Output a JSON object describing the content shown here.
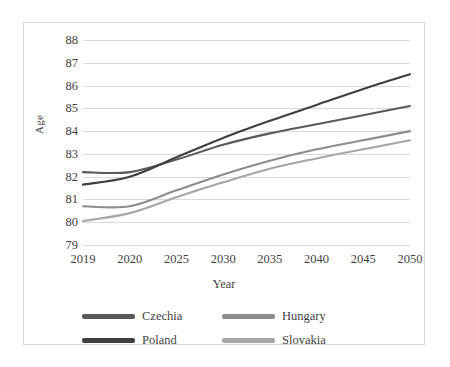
{
  "chart_data": {
    "type": "line",
    "title": "",
    "xlabel": "Year",
    "ylabel": "Age",
    "categories": [
      "2019",
      "2020",
      "2025",
      "2030",
      "2035",
      "2040",
      "2045",
      "2050"
    ],
    "ylim": [
      79,
      88
    ],
    "y_ticks": [
      88,
      87,
      86,
      85,
      84,
      83,
      82,
      81,
      80,
      79
    ],
    "grid": true,
    "legend_position": "bottom",
    "series": [
      {
        "name": "Czechia",
        "color": "#595959",
        "values": [
          82.2,
          82.2,
          82.75,
          83.4,
          83.9,
          84.3,
          84.7,
          85.1
        ]
      },
      {
        "name": "Hungary",
        "color": "#8c8c8c",
        "values": [
          80.7,
          80.7,
          81.4,
          82.1,
          82.7,
          83.2,
          83.6,
          84.0
        ]
      },
      {
        "name": "Poland",
        "color": "#3f3f3f",
        "values": [
          81.65,
          82.0,
          82.85,
          83.7,
          84.45,
          85.15,
          85.85,
          86.5
        ]
      },
      {
        "name": "Slovakia",
        "color": "#a6a6a6",
        "values": [
          80.05,
          80.4,
          81.1,
          81.75,
          82.35,
          82.8,
          83.2,
          83.6
        ]
      }
    ]
  },
  "figure": {
    "border_color": "#d8d8d8",
    "gridline_color": "#d9d9d9",
    "background": "#ffffff"
  }
}
